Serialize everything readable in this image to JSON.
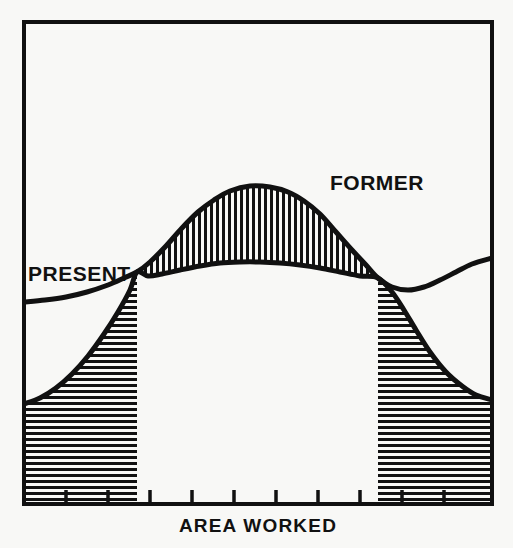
{
  "figure": {
    "background_color": "#f8f8f6",
    "ink_color": "#111111",
    "frame": {
      "left": 24,
      "top": 22,
      "right": 492,
      "bottom": 504,
      "stroke_width": 4
    }
  },
  "labels": {
    "present": "PRESENT",
    "former": "FORMER",
    "x_axis": "AREA WORKED"
  },
  "chart_data": {
    "type": "area",
    "title": "",
    "xlabel": "AREA WORKED",
    "ylabel": "",
    "grid": false,
    "legend_position": "inline-annotations",
    "axis": {
      "x_range_px": [
        24,
        492
      ],
      "y_range_px": [
        22,
        504
      ],
      "x_tick_count": 10,
      "x_ticks_px": [
        66,
        108,
        150,
        192,
        234,
        276,
        318,
        360,
        402,
        444
      ],
      "x_tick_length_px": 14,
      "x_tick_labels": [],
      "y_ticks_px": [],
      "y_tick_labels": []
    },
    "annotations": [
      {
        "text": "PRESENT",
        "x_px": 28,
        "y_px": 281,
        "anchor": "start"
      },
      {
        "text": "FORMER",
        "x_px": 330,
        "y_px": 190,
        "anchor": "start"
      },
      {
        "text": "AREA WORKED",
        "x_px": 258,
        "y_px": 532,
        "anchor": "middle"
      }
    ],
    "series": [
      {
        "name": "FORMER",
        "hatch": "vertical",
        "hatch_pitch_px": 6,
        "description": "Upper boundary curve; encloses the vertically hatched FORMER band over the central hump.",
        "points_px": [
          [
            24,
            302
          ],
          [
            45,
            300
          ],
          [
            66,
            297
          ],
          [
            87,
            292
          ],
          [
            108,
            285
          ],
          [
            124,
            278
          ],
          [
            137,
            272
          ],
          [
            150,
            262
          ],
          [
            166,
            246
          ],
          [
            182,
            228
          ],
          [
            198,
            212
          ],
          [
            214,
            200
          ],
          [
            230,
            191
          ],
          [
            250,
            186
          ],
          [
            270,
            187
          ],
          [
            288,
            192
          ],
          [
            304,
            201
          ],
          [
            320,
            214
          ],
          [
            336,
            232
          ],
          [
            352,
            250
          ],
          [
            366,
            265
          ],
          [
            378,
            278
          ],
          [
            392,
            287
          ],
          [
            408,
            290
          ],
          [
            424,
            287
          ],
          [
            440,
            280
          ],
          [
            456,
            272
          ],
          [
            472,
            264
          ],
          [
            492,
            258
          ]
        ]
      },
      {
        "name": "PRESENT",
        "hatch": "horizontal",
        "hatch_pitch_px": 6,
        "description": "Lower boundary curve; encloses the horizontally hatched PRESENT bands at the left and right flanks.",
        "points_px": [
          [
            24,
            404
          ],
          [
            40,
            398
          ],
          [
            56,
            388
          ],
          [
            72,
            374
          ],
          [
            88,
            356
          ],
          [
            104,
            334
          ],
          [
            118,
            312
          ],
          [
            130,
            290
          ],
          [
            137,
            272
          ],
          [
            148,
            276
          ],
          [
            162,
            274
          ],
          [
            180,
            270
          ],
          [
            200,
            266
          ],
          [
            220,
            263
          ],
          [
            240,
            262
          ],
          [
            260,
            262
          ],
          [
            280,
            263
          ],
          [
            300,
            265
          ],
          [
            320,
            268
          ],
          [
            340,
            272
          ],
          [
            360,
            276
          ],
          [
            378,
            278
          ],
          [
            392,
            292
          ],
          [
            404,
            310
          ],
          [
            416,
            330
          ],
          [
            430,
            352
          ],
          [
            446,
            372
          ],
          [
            462,
            386
          ],
          [
            476,
            395
          ],
          [
            492,
            400
          ]
        ]
      }
    ],
    "bands": [
      {
        "name": "FORMER",
        "hatch": "vertical",
        "x_span_px": [
          137,
          378
        ],
        "note": "Region where the FORMER curve lies above the PRESENT curve."
      },
      {
        "name": "PRESENT-left",
        "hatch": "horizontal",
        "x_span_px": [
          24,
          137
        ],
        "note": "Left flank region where the PRESENT curve lies below the FORMER curve."
      },
      {
        "name": "PRESENT-right",
        "hatch": "horizontal",
        "x_span_px": [
          378,
          492
        ],
        "note": "Right flank region where the PRESENT curve lies below the FORMER curve."
      }
    ],
    "crossings_px": [
      [
        137,
        272
      ],
      [
        378,
        278
      ]
    ]
  }
}
